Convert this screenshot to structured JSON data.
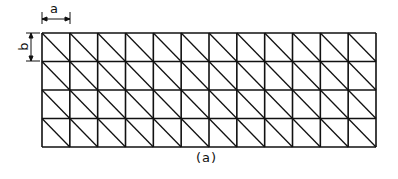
{
  "diagram": {
    "type": "triangulated rectangular mesh",
    "columns": 12,
    "rows": 4,
    "diagonal_direction": "top-left to bottom-right",
    "dimension_labels": {
      "horizontal": "a",
      "vertical": "b"
    },
    "caption": "(a)",
    "colors": {
      "line": "#111111",
      "background": "#ffffff"
    }
  }
}
